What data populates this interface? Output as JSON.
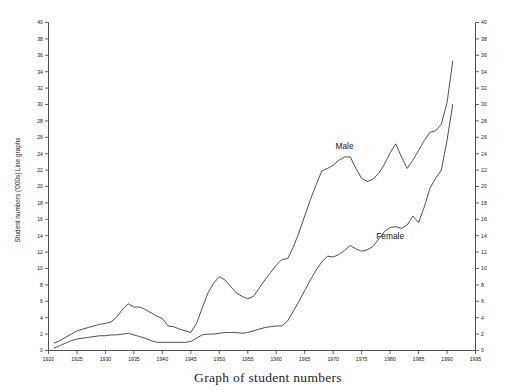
{
  "figure": {
    "background_color": "#ffffff",
    "line_color": "#303030",
    "axis_color": "#3c3c3c",
    "text_color": "#1a1a1a"
  },
  "chart_data": {
    "type": "line",
    "title": "Graph of student numbers",
    "xlabel": "",
    "ylabel": "Student numbers ('000s) Line graphs",
    "xlim": [
      1920,
      1995
    ],
    "ylim": [
      0,
      40
    ],
    "grid": false,
    "legend_position": "inline-annotation",
    "x_tick_labels": [
      "1920",
      "1925",
      "1930",
      "1935",
      "1940",
      "1945",
      "1950",
      "1955",
      "1960",
      "1965",
      "1970",
      "1975",
      "1980",
      "1985",
      "1990",
      "1995"
    ],
    "x_ticks": [
      1920,
      1925,
      1930,
      1935,
      1940,
      1945,
      1950,
      1955,
      1960,
      1965,
      1970,
      1975,
      1980,
      1985,
      1990,
      1995
    ],
    "y_tick_labels": [
      "0",
      "2",
      "4",
      "6",
      "8",
      "10",
      "12",
      "14",
      "16",
      "18",
      "20",
      "22",
      "24",
      "26",
      "28",
      "30",
      "32",
      "34",
      "36",
      "38",
      "40"
    ],
    "y_ticks": [
      0,
      2,
      4,
      6,
      8,
      10,
      12,
      14,
      16,
      18,
      20,
      22,
      24,
      26,
      28,
      30,
      32,
      34,
      36,
      38,
      40
    ],
    "y_axis_both_sides": true,
    "series": [
      {
        "name": "Male",
        "label_x": 1972,
        "label_y": 24.6,
        "x": [
          1921,
          1922,
          1923,
          1924,
          1925,
          1926,
          1927,
          1928,
          1929,
          1930,
          1931,
          1932,
          1933,
          1934,
          1935,
          1936,
          1937,
          1938,
          1939,
          1940,
          1941,
          1942,
          1943,
          1944,
          1945,
          1946,
          1947,
          1948,
          1949,
          1950,
          1951,
          1952,
          1953,
          1954,
          1955,
          1956,
          1957,
          1958,
          1959,
          1960,
          1961,
          1962,
          1963,
          1964,
          1965,
          1966,
          1967,
          1968,
          1969,
          1970,
          1971,
          1972,
          1973,
          1974,
          1975,
          1976,
          1977,
          1978,
          1979,
          1980,
          1981,
          1982,
          1983,
          1984,
          1985,
          1986,
          1987,
          1988,
          1989,
          1990,
          1991
        ],
        "y": [
          0.9,
          1.2,
          1.6,
          2.0,
          2.4,
          2.6,
          2.8,
          3.0,
          3.2,
          3.3,
          3.5,
          4.1,
          5.0,
          5.7,
          5.3,
          5.3,
          5.0,
          4.6,
          4.2,
          3.9,
          3.0,
          2.9,
          2.6,
          2.4,
          2.2,
          3.3,
          5.2,
          7.0,
          8.2,
          9.0,
          8.6,
          7.8,
          7.0,
          6.6,
          6.3,
          6.6,
          7.6,
          8.6,
          9.5,
          10.4,
          11.1,
          11.2,
          12.6,
          14.4,
          16.4,
          18.4,
          20.2,
          21.9,
          22.2,
          22.6,
          23.2,
          23.6,
          23.6,
          22.2,
          21.0,
          20.6,
          20.9,
          21.6,
          22.7,
          24.1,
          25.2,
          23.6,
          22.2,
          23.2,
          24.4,
          25.6,
          26.6,
          26.8,
          27.6,
          30.2,
          35.3
        ],
        "units": "'000s"
      },
      {
        "name": "Female",
        "label_x": 1980,
        "label_y": 13.6,
        "x": [
          1921,
          1922,
          1923,
          1924,
          1925,
          1926,
          1927,
          1928,
          1929,
          1930,
          1931,
          1932,
          1933,
          1934,
          1935,
          1936,
          1937,
          1938,
          1939,
          1940,
          1941,
          1942,
          1943,
          1944,
          1945,
          1946,
          1947,
          1948,
          1949,
          1950,
          1951,
          1952,
          1953,
          1954,
          1955,
          1956,
          1957,
          1958,
          1959,
          1960,
          1961,
          1962,
          1963,
          1964,
          1965,
          1966,
          1967,
          1968,
          1969,
          1970,
          1971,
          1972,
          1973,
          1974,
          1975,
          1976,
          1977,
          1978,
          1979,
          1980,
          1981,
          1982,
          1983,
          1984,
          1985,
          1986,
          1987,
          1988,
          1989,
          1990,
          1991
        ],
        "y": [
          0.3,
          0.6,
          0.9,
          1.2,
          1.4,
          1.5,
          1.6,
          1.7,
          1.8,
          1.8,
          1.9,
          1.9,
          2.0,
          2.1,
          1.9,
          1.7,
          1.5,
          1.2,
          1.0,
          1.0,
          1.0,
          1.0,
          1.0,
          1.0,
          1.1,
          1.5,
          1.9,
          2.0,
          2.0,
          2.1,
          2.2,
          2.2,
          2.2,
          2.1,
          2.2,
          2.4,
          2.6,
          2.8,
          2.9,
          3.0,
          3.0,
          3.6,
          4.8,
          6.0,
          7.3,
          8.6,
          9.8,
          10.8,
          11.5,
          11.4,
          11.7,
          12.2,
          12.8,
          12.4,
          12.1,
          12.3,
          12.7,
          13.6,
          14.5,
          15.0,
          15.1,
          14.9,
          15.3,
          16.4,
          15.6,
          17.5,
          19.8,
          21.0,
          22.0,
          25.6,
          30.0
        ],
        "units": "'000s"
      }
    ]
  }
}
